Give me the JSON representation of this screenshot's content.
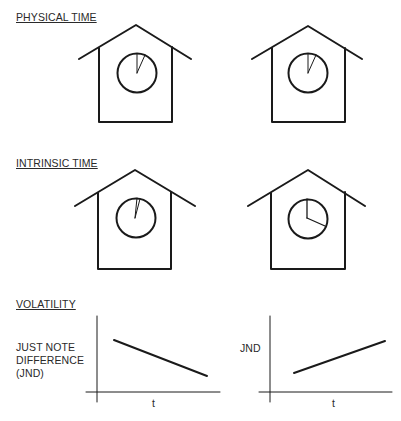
{
  "sections": {
    "physical_time": {
      "title": "PHYSICAL TIME",
      "clocks": [
        {
          "id": "physical-left",
          "hand_angles_deg": [
            0,
            25
          ]
        },
        {
          "id": "physical-right",
          "hand_angles_deg": [
            0,
            25
          ]
        }
      ]
    },
    "intrinsic_time": {
      "title": "INTRINSIC TIME",
      "clocks": [
        {
          "id": "intrinsic-left",
          "hand_angles_deg": [
            0,
            8
          ]
        },
        {
          "id": "intrinsic-right",
          "hand_angles_deg": [
            0,
            115
          ]
        }
      ]
    },
    "volatility": {
      "title": "VOLATILITY",
      "left_chart": {
        "ylabel_lines": [
          "JUST NOTE",
          "DIFFERENCE",
          "(JND)"
        ],
        "xlabel": "t",
        "trend": "decreasing"
      },
      "right_chart": {
        "ylabel": "JND",
        "xlabel": "t",
        "trend": "increasing"
      }
    }
  },
  "colors": {
    "stroke": "#1a1a1a",
    "text": "#2a2a2a",
    "background": "#ffffff"
  }
}
